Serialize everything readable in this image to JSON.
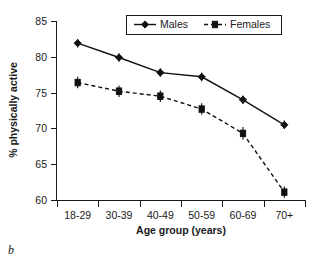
{
  "caption": "b",
  "chart_data": {
    "type": "line",
    "title": "",
    "xlabel": "Age group (years)",
    "ylabel": "% physically active",
    "categories": [
      "18-29",
      "30-39",
      "40-49",
      "50-59",
      "60-69",
      "70+"
    ],
    "ylim": [
      60,
      85
    ],
    "yticks": [
      60,
      65,
      70,
      75,
      80,
      85
    ],
    "ytick_labels": [
      "60",
      "65",
      "70",
      "75",
      "80",
      "85"
    ],
    "grid": false,
    "legend_position": "top-center",
    "series": [
      {
        "name": "Males",
        "values": [
          81.9,
          79.9,
          77.8,
          77.2,
          74.0,
          70.5
        ],
        "marker": "diamond",
        "linestyle": "solid",
        "color": "#111111",
        "error_bars": [
          0.6,
          0.6,
          0.6,
          0.6,
          0.6,
          0.6
        ]
      },
      {
        "name": "Females",
        "values": [
          76.4,
          75.2,
          74.5,
          72.7,
          69.3,
          61.1
        ],
        "marker": "square",
        "linestyle": "dashed",
        "color": "#111111",
        "error_bars": [
          0.8,
          0.8,
          0.8,
          0.8,
          0.9,
          0.8
        ]
      }
    ]
  }
}
